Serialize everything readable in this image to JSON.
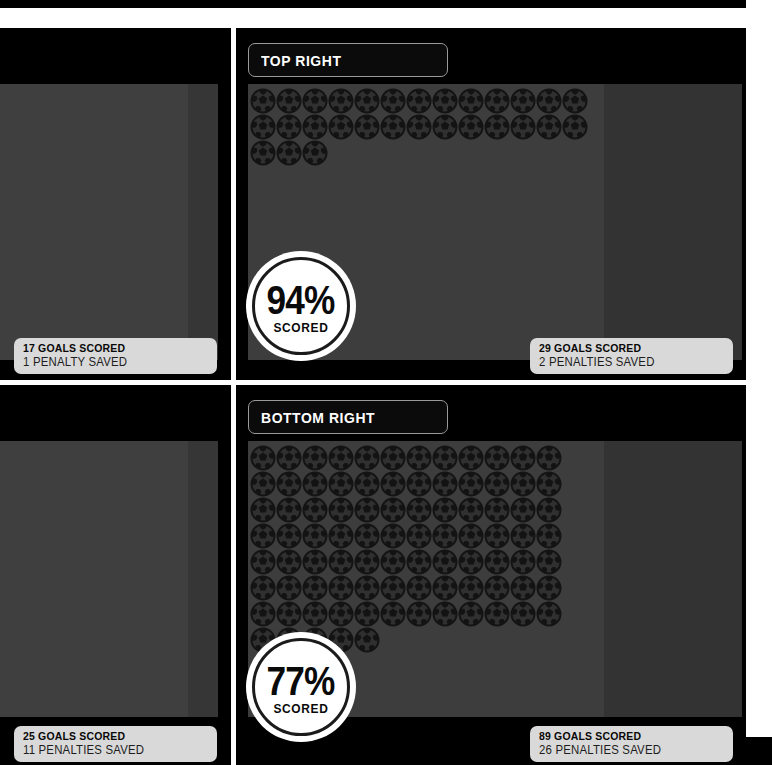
{
  "meta": {
    "icon_name": "soccer-ball-icon"
  },
  "colors": {
    "background": "#000000",
    "panel": "#3b3b3b",
    "panel_shade": "#333333",
    "divider": "#ffffff",
    "pill_bg": "#d9d9d9",
    "pill_text": "#080808",
    "badge_bg": "#ffffff",
    "badge_ring": "#1b1b1b",
    "title_border": "#9a9a9a",
    "title_text": "#ffffff"
  },
  "quadrants": [
    {
      "id": "top-left",
      "title": "",
      "title_visible": false,
      "goals_scored_label": "17 GOALS SCORED",
      "penalties_saved_label": "1 PENALTY SAVED",
      "goals_scored": 17,
      "penalties_saved": 1,
      "balls_shown": 0,
      "badge_visible": false,
      "badge_percent": "",
      "badge_sub": ""
    },
    {
      "id": "top-right",
      "title": "TOP RIGHT",
      "title_visible": true,
      "goals_scored_label": "29 GOALS SCORED",
      "penalties_saved_label": "2 PENALTIES SAVED",
      "goals_scored": 29,
      "penalties_saved": 2,
      "balls_shown": 29,
      "columns": 13,
      "badge_visible": true,
      "badge_percent": "94%",
      "badge_sub": "SCORED"
    },
    {
      "id": "bottom-left",
      "title": "",
      "title_visible": false,
      "goals_scored_label": "25 GOALS SCORED",
      "penalties_saved_label": "11 PENALTIES SAVED",
      "goals_scored": 25,
      "penalties_saved": 11,
      "balls_shown": 0,
      "badge_visible": false,
      "badge_percent": "",
      "badge_sub": ""
    },
    {
      "id": "bottom-right",
      "title": "BOTTOM RIGHT",
      "title_visible": true,
      "goals_scored_label": "89 GOALS SCORED",
      "penalties_saved_label": "26 PENALTIES SAVED",
      "goals_scored": 89,
      "penalties_saved": 26,
      "balls_shown": 89,
      "columns": 12,
      "badge_visible": true,
      "badge_percent": "77%",
      "badge_sub": "SCORED"
    }
  ],
  "chart_data": {
    "type": "bar",
    "xlabel": "Placement zone",
    "ylabel": "Goals scored",
    "categories": [
      "Top Left",
      "Top Right",
      "Bottom Left",
      "Bottom Right"
    ],
    "series": [
      {
        "name": "Goals scored",
        "values": [
          17,
          29,
          25,
          89
        ]
      },
      {
        "name": "Penalties saved",
        "values": [
          1,
          2,
          11,
          26
        ]
      },
      {
        "name": "Scored percentage",
        "values": [
          null,
          94,
          null,
          77
        ]
      }
    ],
    "annotations": [
      "94% SCORED",
      "77% SCORED"
    ],
    "legend": "none",
    "grid": false,
    "note": "Each soccer-ball glyph represents one goal scored."
  }
}
